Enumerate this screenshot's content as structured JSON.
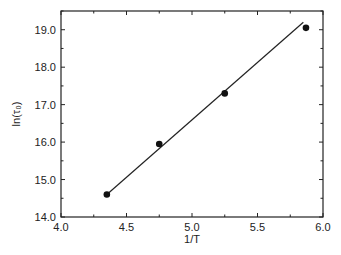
{
  "chart_data": {
    "type": "scatter",
    "title": "",
    "xlabel": "1/T",
    "ylabel": "ln(τ₀)",
    "xlim": [
      4.0,
      6.0
    ],
    "ylim": [
      14.0,
      19.5
    ],
    "xticks": [
      "4.0",
      "4.5",
      "5.0",
      "5.5",
      "6.0"
    ],
    "yticks": [
      "14.0",
      "15.0",
      "16.0",
      "17.0",
      "18.0",
      "19.0"
    ],
    "grid": false,
    "legend": null,
    "series": [
      {
        "name": "data",
        "type": "scatter",
        "marker": "filled-circle",
        "x": [
          4.35,
          4.75,
          5.25,
          5.87
        ],
        "y": [
          14.6,
          15.95,
          17.3,
          19.05
        ]
      },
      {
        "name": "linear fit",
        "type": "line",
        "x": [
          4.35,
          5.85
        ],
        "y": [
          14.6,
          19.2
        ]
      }
    ]
  }
}
